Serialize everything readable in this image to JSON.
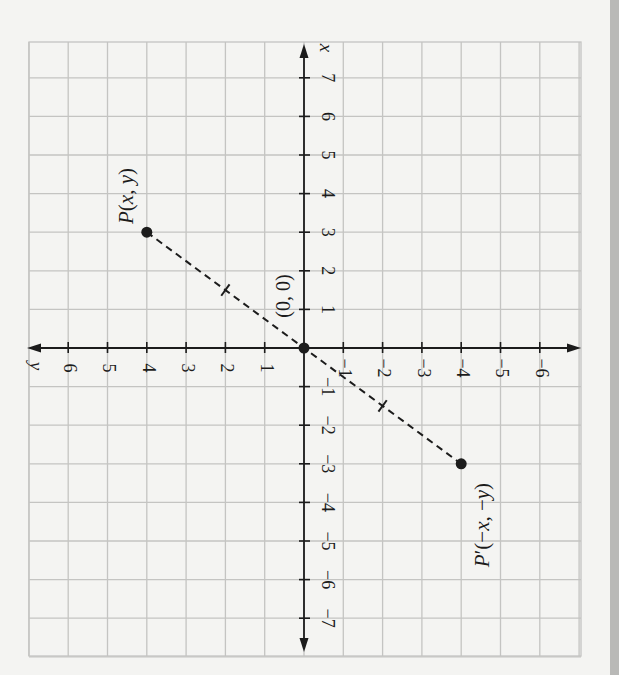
{
  "chart_data": {
    "type": "scatter",
    "title": "",
    "orientation": "rotated 90° clockwise (x-axis vertical pointing up, y-axis horizontal pointing left)",
    "xlabel": "x",
    "ylabel": "y",
    "xlim": [
      -7,
      7
    ],
    "ylim": [
      -6,
      6
    ],
    "grid": true,
    "x_ticks": [
      -7,
      -6,
      -5,
      -4,
      -3,
      -2,
      -1,
      1,
      2,
      3,
      4,
      5,
      6,
      7
    ],
    "x_tick_labels": [
      "−7",
      "−6",
      "−5",
      "−4",
      "−3",
      "−2",
      "−1",
      "1",
      "2",
      "3",
      "4",
      "5",
      "6",
      "7"
    ],
    "y_ticks": [
      -6,
      -5,
      -4,
      -3,
      -2,
      -1,
      1,
      2,
      3,
      4,
      5,
      6
    ],
    "y_tick_labels": [
      "−6",
      "−5",
      "−4",
      "−3",
      "−2",
      "−1",
      "1",
      "2",
      "3",
      "4",
      "5",
      "6"
    ],
    "points": [
      {
        "name": "P",
        "label": "P(x, y)",
        "x": 3,
        "y": 4
      },
      {
        "name": "O",
        "label": "(0, 0)",
        "x": 0,
        "y": 0
      },
      {
        "name": "P'",
        "label": "P′(−x, −y)",
        "x": -3,
        "y": -4
      }
    ],
    "segments": [
      {
        "from": "P",
        "to": "P'",
        "style": "dashed",
        "tick_marks_at": [
          [
            1.5,
            2
          ],
          [
            -1.5,
            -2
          ]
        ]
      }
    ],
    "annotations": [
      "P(x, y)",
      "(0, 0)",
      "P′(−x, −y)"
    ]
  },
  "labels": {
    "x_axis": "x",
    "y_axis": "y",
    "origin": "(0, 0)",
    "point_p": "P(x, y)",
    "point_p_prime": "P′(−x, −y)"
  },
  "colors": {
    "paper": "#f4f4f2",
    "grid": "#c4c4c2",
    "axis": "#1c1c1c",
    "side_strip": "#b9b9b7"
  }
}
